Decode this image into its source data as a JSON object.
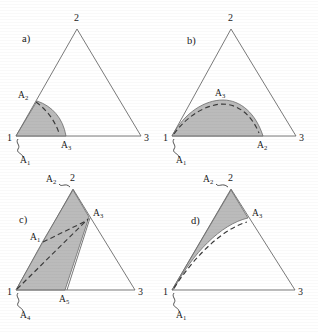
{
  "figure": {
    "title": "",
    "background_color": "#ffffff",
    "shade_color": "#a8a8a8",
    "line_color": "#6b6b6b",
    "dash_color": "#3a3a3a",
    "panels": [
      {
        "id": "a",
        "panel_label": "a)",
        "vertices": [
          {
            "name": "vertex-1",
            "label": "1"
          },
          {
            "name": "vertex-2",
            "label": "2"
          },
          {
            "name": "vertex-3",
            "label": "3"
          }
        ],
        "point_labels": [
          {
            "name": "point-A2",
            "label": "A",
            "sub": "2"
          },
          {
            "name": "point-A3",
            "label": "A",
            "sub": "3"
          }
        ],
        "callout_labels": [
          {
            "name": "callout-A1",
            "label": "A",
            "sub": "1"
          }
        ]
      },
      {
        "id": "b",
        "panel_label": "b)",
        "vertices": [
          {
            "name": "vertex-1",
            "label": "1"
          },
          {
            "name": "vertex-2",
            "label": "2"
          },
          {
            "name": "vertex-3",
            "label": "3"
          }
        ],
        "point_labels": [
          {
            "name": "point-A3",
            "label": "A",
            "sub": "3"
          },
          {
            "name": "point-A2",
            "label": "A",
            "sub": "2"
          }
        ],
        "callout_labels": [
          {
            "name": "callout-A1",
            "label": "A",
            "sub": "1"
          }
        ]
      },
      {
        "id": "c",
        "panel_label": "c)",
        "vertices": [
          {
            "name": "vertex-1",
            "label": "1"
          },
          {
            "name": "vertex-2",
            "label": "2"
          },
          {
            "name": "vertex-3",
            "label": "3"
          }
        ],
        "point_labels": [
          {
            "name": "point-A2",
            "label": "A",
            "sub": "2"
          },
          {
            "name": "point-A3",
            "label": "A",
            "sub": "3"
          },
          {
            "name": "point-A1",
            "label": "A",
            "sub": "1"
          },
          {
            "name": "point-A5",
            "label": "A",
            "sub": "5"
          }
        ],
        "callout_labels": [
          {
            "name": "callout-A4",
            "label": "A",
            "sub": "4"
          }
        ]
      },
      {
        "id": "d",
        "panel_label": "d)",
        "vertices": [
          {
            "name": "vertex-1",
            "label": "1"
          },
          {
            "name": "vertex-2",
            "label": "2"
          },
          {
            "name": "vertex-3",
            "label": "3"
          }
        ],
        "point_labels": [
          {
            "name": "point-A2",
            "label": "A",
            "sub": "2"
          },
          {
            "name": "point-A3",
            "label": "A",
            "sub": "3"
          }
        ],
        "callout_labels": [
          {
            "name": "callout-A1",
            "label": "A",
            "sub": "1"
          }
        ]
      }
    ]
  }
}
